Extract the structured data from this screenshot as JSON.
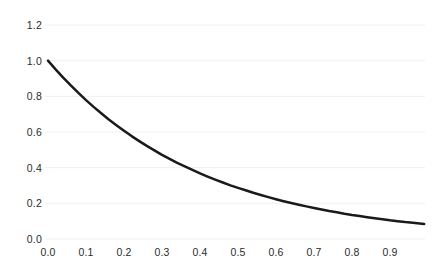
{
  "chart_data": {
    "type": "line",
    "title": "",
    "subtitle": "",
    "xlabel": "",
    "ylabel": "",
    "xlim": [
      0.0,
      0.99
    ],
    "ylim": [
      0.0,
      1.2
    ],
    "grid": "horizontal",
    "legend": "none",
    "xticks": [
      "0.0",
      "0.1",
      "0.2",
      "0.3",
      "0.4",
      "0.5",
      "0.6",
      "0.7",
      "0.8",
      "0.9"
    ],
    "xtick_values": [
      0.0,
      0.1,
      0.2,
      0.3,
      0.4,
      0.5,
      0.6,
      0.7,
      0.8,
      0.9
    ],
    "yticks": [
      "0.0",
      "0.2",
      "0.4",
      "0.6",
      "0.8",
      "1.0",
      "1.2"
    ],
    "ytick_values": [
      0.0,
      0.2,
      0.4,
      0.6,
      0.8,
      1.0,
      1.2
    ],
    "series": [
      {
        "name": "decay",
        "color": "#1a1a1a",
        "linewidth": 2.5,
        "x": [
          0.0,
          0.02,
          0.04,
          0.06,
          0.08,
          0.1,
          0.12,
          0.14,
          0.16,
          0.18,
          0.2,
          0.22,
          0.24,
          0.26,
          0.28,
          0.3,
          0.32,
          0.34,
          0.36,
          0.38,
          0.4,
          0.42,
          0.44,
          0.46,
          0.48,
          0.5,
          0.52,
          0.54,
          0.56,
          0.58,
          0.6,
          0.62,
          0.64,
          0.66,
          0.68,
          0.7,
          0.72,
          0.74,
          0.76,
          0.78,
          0.8,
          0.82,
          0.84,
          0.86,
          0.88,
          0.9,
          0.92,
          0.94,
          0.96,
          0.99
        ],
        "y": [
          1.0,
          0.951,
          0.905,
          0.861,
          0.819,
          0.779,
          0.741,
          0.705,
          0.67,
          0.638,
          0.607,
          0.577,
          0.549,
          0.522,
          0.497,
          0.472,
          0.449,
          0.427,
          0.407,
          0.387,
          0.368,
          0.35,
          0.333,
          0.317,
          0.301,
          0.287,
          0.273,
          0.259,
          0.247,
          0.235,
          0.223,
          0.212,
          0.202,
          0.192,
          0.183,
          0.174,
          0.165,
          0.157,
          0.15,
          0.142,
          0.135,
          0.129,
          0.122,
          0.116,
          0.111,
          0.105,
          0.1,
          0.095,
          0.091,
          0.084
        ]
      }
    ]
  },
  "axes": {
    "plot_left_px": 48,
    "plot_right_px": 425,
    "plot_top_px": 25,
    "plot_bottom_px": 239,
    "gridline_color": "#f0f0f0",
    "label_color": "#2b2b2b",
    "background": "#ffffff"
  }
}
